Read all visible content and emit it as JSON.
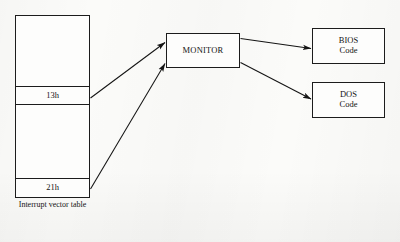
{
  "figure": {
    "type": "block-flow-diagram",
    "background_color": "#fbfbf9",
    "line_color": "#1c1c1c"
  },
  "nodes": {
    "interrupt_vector_table": {
      "caption_line1": "Interrupt vector",
      "caption_line2": "table",
      "rows": [
        {
          "label": "13h"
        },
        {
          "label": "21h"
        }
      ]
    },
    "monitor": {
      "label": "MONITOR"
    },
    "bios": {
      "line1": "BIOS",
      "line2": "Code"
    },
    "dos": {
      "line1": "DOS",
      "line2": "Code"
    }
  },
  "edges": [
    {
      "from": "13h",
      "to": "MONITOR",
      "arrowhead": "end"
    },
    {
      "from": "21h",
      "to": "MONITOR",
      "arrowhead": "end"
    },
    {
      "from": "MONITOR",
      "to": "BIOS Code",
      "arrowhead": "end"
    },
    {
      "from": "MONITOR",
      "to": "DOS Code",
      "arrowhead": "end"
    }
  ]
}
